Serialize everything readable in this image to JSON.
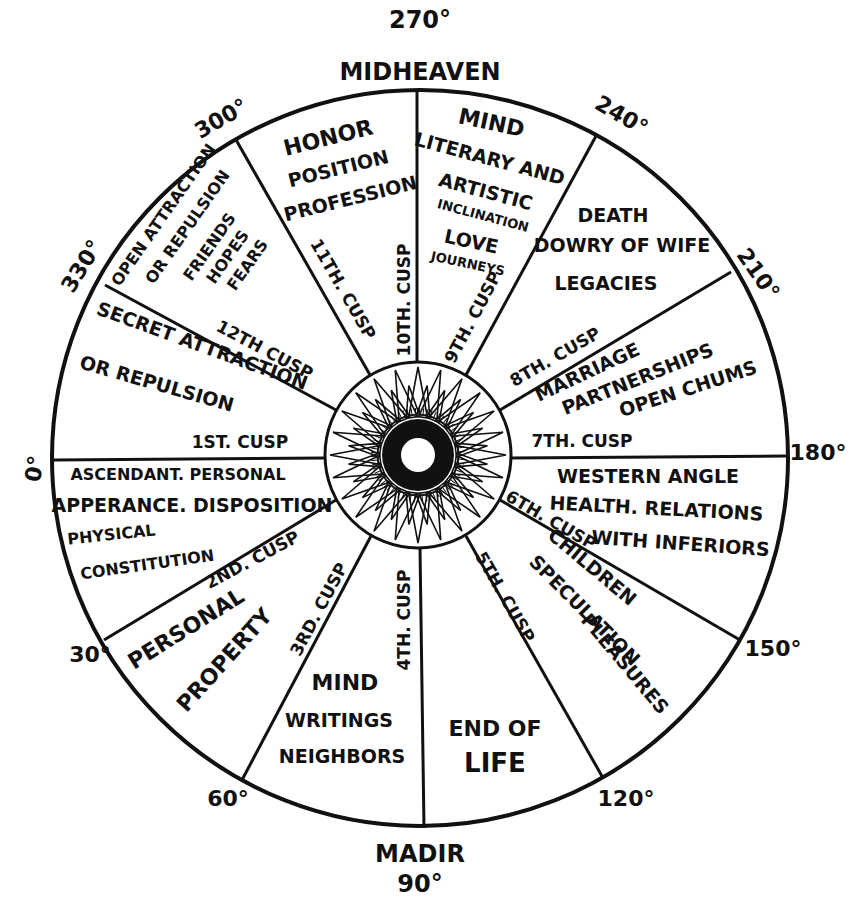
{
  "diagram": {
    "title_top": {
      "degree": "270°",
      "label": "MIDHEAVEN"
    },
    "title_bottom": {
      "label": "MADIR",
      "degree": "90°"
    },
    "colors": {
      "ink": "#111111",
      "paper": "#ffffff"
    },
    "degree_marks": [
      {
        "id": "deg-0",
        "label": "0°"
      },
      {
        "id": "deg-30",
        "label": "30°"
      },
      {
        "id": "deg-60",
        "label": "60°"
      },
      {
        "id": "deg-120",
        "label": "120°"
      },
      {
        "id": "deg-150",
        "label": "150°"
      },
      {
        "id": "deg-180",
        "label": "180°"
      },
      {
        "id": "deg-210",
        "label": "210°"
      },
      {
        "id": "deg-240",
        "label": "240°"
      },
      {
        "id": "deg-300",
        "label": "300°"
      },
      {
        "id": "deg-330",
        "label": "330°"
      }
    ],
    "cusps": [
      "1ST. CUSP",
      "2ND. CUSP",
      "3RD. CUSP",
      "4TH. CUSP",
      "5TH. CUSP",
      "6TH. CUSP",
      "7TH. CUSP",
      "8TH. CUSP",
      "9TH. CUSP",
      "10TH. CUSP",
      "11TH. CUSP",
      "12TH CUSP"
    ],
    "houses": {
      "h1": [
        "ASCENDANT. PERSONAL",
        "APPERANCE. DISPOSITION",
        "PHYSICAL",
        "CONSTITUTION"
      ],
      "h2": [
        "PERSONAL",
        "PROPERTY"
      ],
      "h3": [
        "MIND",
        "WRITINGS",
        "NEIGHBORS"
      ],
      "h4": [
        "END OF",
        "LIFE"
      ],
      "h5": [
        "CHILDREN",
        "SPECULATION",
        "PLEASURES"
      ],
      "h6": [
        "WESTERN ANGLE",
        "HEALTH. RELATIONS",
        "WITH INFERIORS"
      ],
      "h7": [
        "MARRIAGE",
        "PARTNERSHIPS",
        "OPEN CHUMS"
      ],
      "h8": [
        "DEATH",
        "DOWRY OF WIFE",
        "LEGACIES"
      ],
      "h9": [
        "MIND",
        "LITERARY AND",
        "ARTISTIC",
        "INCLINATION",
        "LOVE",
        "JOURNEYS"
      ],
      "h10": [
        "HONOR",
        "POSITION",
        "PROFESSION"
      ],
      "h11": [
        "OPEN ATTRACTION",
        "OR REPULSION",
        "FRIENDS",
        "HOPES",
        "FEARS"
      ],
      "h12": [
        "SECRET ATTRACTION",
        "OR REPULSION"
      ]
    }
  }
}
